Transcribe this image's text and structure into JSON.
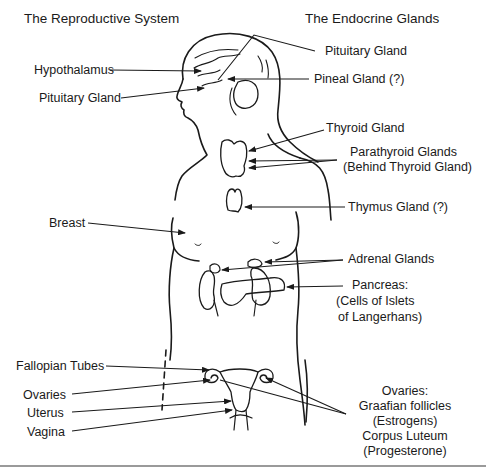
{
  "diagram": {
    "titles": {
      "left": "The Reproductive System",
      "right": "The Endocrine Glands"
    },
    "left_labels": {
      "hypothalamus": "Hypothalamus",
      "pituitary": "Pituitary Gland",
      "breast": "Breast",
      "fallopian_tubes": "Fallopian Tubes",
      "ovaries": "Ovaries",
      "uterus": "Uterus",
      "vagina": "Vagina"
    },
    "right_labels": {
      "pituitary": "Pituitary Gland",
      "pineal": "Pineal Gland (?)",
      "thyroid": "Thyroid Gland",
      "parathyroid_line1": "Parathyroid Glands",
      "parathyroid_line2": "(Behind Thyroid Gland)",
      "thymus": "Thymus Gland (?)",
      "adrenal": "Adrenal Glands",
      "pancreas_line1": "Pancreas:",
      "pancreas_line2": "(Cells of Islets",
      "pancreas_line3": "of Langerhans)",
      "ovaries_line1": "Ovaries:",
      "ovaries_line2": "Graafian follicles",
      "ovaries_line3": "(Estrogens)",
      "ovaries_line4": "Corpus Luteum",
      "ovaries_line5": "(Progesterone)"
    },
    "colors": {
      "ink": "#1a1a1a",
      "background": "#ffffff",
      "bottom_rule": "#9a9a9a"
    }
  }
}
